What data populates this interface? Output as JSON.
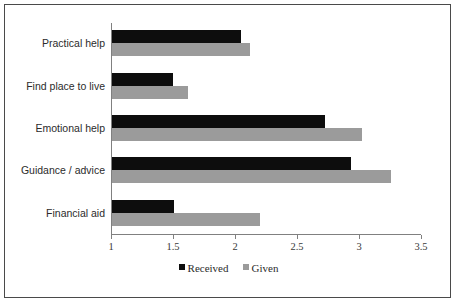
{
  "chart_data": {
    "type": "bar",
    "orientation": "horizontal",
    "title": "",
    "subtitle": "",
    "xlabel": "",
    "ylabel": "",
    "xlim": [
      1,
      3.5
    ],
    "grid": false,
    "legend_position": "bottom",
    "categories": [
      "Practical help",
      "Find place to live",
      "Emotional help",
      "Guidance / advice",
      "Financial aid"
    ],
    "tick_labels": [
      "1",
      "1.5",
      "2",
      "2.5",
      "3",
      "3.5"
    ],
    "tick_values": [
      1,
      1.5,
      2,
      2.5,
      3,
      3.5
    ],
    "series": [
      {
        "name": "Received",
        "color": "#0d0d0d",
        "values": [
          2.04,
          1.49,
          2.72,
          2.93,
          1.5
        ]
      },
      {
        "name": "Given",
        "color": "#9b9b9b",
        "values": [
          2.11,
          1.61,
          3.02,
          3.25,
          2.19
        ]
      }
    ]
  },
  "legend": {
    "items": [
      {
        "label": "Received",
        "color": "#0d0d0d"
      },
      {
        "label": "Given",
        "color": "#9b9b9b"
      }
    ]
  },
  "colors": {
    "received": "#0d0d0d",
    "given": "#9b9b9b",
    "axis": "#808080",
    "frame_border": "#4a4a4a",
    "text": "#2b2b2b",
    "background": "#ffffff"
  }
}
